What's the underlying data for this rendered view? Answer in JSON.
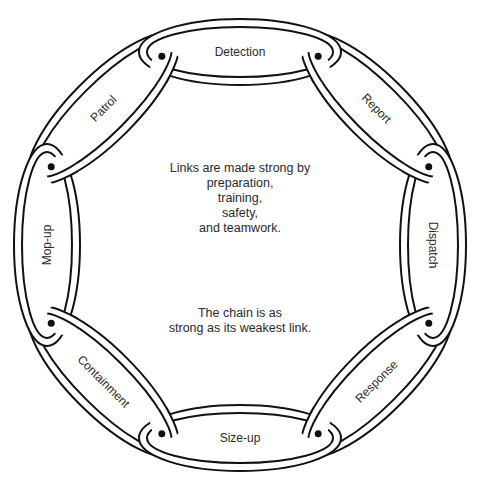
{
  "diagram": {
    "type": "chain-cycle",
    "links": [
      {
        "label": "Detection"
      },
      {
        "label": "Report"
      },
      {
        "label": "Dispatch"
      },
      {
        "label": "Response"
      },
      {
        "label": "Size-up"
      },
      {
        "label": "Containment"
      },
      {
        "label": "Mop-up"
      },
      {
        "label": "Patrol"
      }
    ],
    "center_text": {
      "motto_lines": [
        "Links are made strong by",
        "preparation,",
        "training,",
        "safety,",
        "and teamwork."
      ],
      "weakest_lines": [
        "The chain is as",
        "strong as its weakest link."
      ]
    },
    "colors": {
      "stroke": "#111111",
      "fill": "#ffffff",
      "text": "#2a2a2a"
    }
  }
}
